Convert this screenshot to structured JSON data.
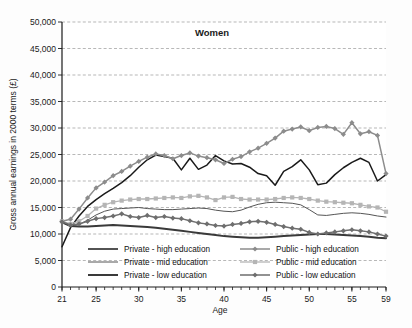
{
  "chart_data": {
    "type": "line",
    "title": "Women",
    "xlabel": "Age",
    "ylabel": "Gross annual earnings in 2000 terms (£)",
    "xlim": [
      21,
      59
    ],
    "ylim": [
      0,
      50000
    ],
    "ytick_labels": [
      "0",
      "5,000",
      "10,000",
      "15,000",
      "20,000",
      "25,000",
      "30,000",
      "35,000",
      "40,000",
      "45,000",
      "50,000"
    ],
    "ytick_values": [
      0,
      5000,
      10000,
      15000,
      20000,
      25000,
      30000,
      35000,
      40000,
      45000,
      50000
    ],
    "xtick_labels": [
      "21",
      "25",
      "30",
      "35",
      "40",
      "45",
      "50",
      "55",
      "59"
    ],
    "xtick_values": [
      21,
      25,
      30,
      35,
      40,
      45,
      50,
      55,
      59
    ],
    "grid": "horizontal-dashed",
    "legend_position": "inside-bottom",
    "x": [
      21,
      22,
      23,
      24,
      25,
      26,
      27,
      28,
      29,
      30,
      31,
      32,
      33,
      34,
      35,
      36,
      37,
      38,
      39,
      40,
      41,
      42,
      43,
      44,
      45,
      46,
      47,
      48,
      49,
      50,
      51,
      52,
      53,
      54,
      55,
      56,
      57,
      58,
      59
    ],
    "series": [
      {
        "name": "Private - high education",
        "color": "#1a1a1a",
        "marker": "none",
        "width": 1.5,
        "values": [
          7600,
          11200,
          13400,
          15200,
          16500,
          17600,
          18600,
          19700,
          21000,
          22600,
          24000,
          24900,
          24600,
          24300,
          22100,
          24300,
          22200,
          23000,
          24800,
          23800,
          23200,
          23300,
          22600,
          21400,
          21000,
          19200,
          21800,
          22700,
          24000,
          22100,
          19300,
          19600,
          21200,
          22500,
          23500,
          24300,
          23500,
          20000,
          21200
        ]
      },
      {
        "name": "Private - mid education",
        "color": "#555555",
        "marker": "none",
        "width": 1.0,
        "values": [
          12300,
          11600,
          11800,
          12600,
          13600,
          14300,
          14700,
          14800,
          14900,
          15000,
          14800,
          14700,
          14600,
          14600,
          14700,
          14800,
          14900,
          14800,
          14500,
          14300,
          14200,
          14500,
          15100,
          15600,
          15900,
          16000,
          15900,
          15800,
          15500,
          14600,
          13600,
          13500,
          13700,
          13900,
          14000,
          13900,
          13700,
          13400,
          13200
        ]
      },
      {
        "name": "Private - low education",
        "color": "#3a3a3a",
        "marker": "none",
        "width": 2.0,
        "values": [
          12200,
          11500,
          11400,
          11400,
          11500,
          11600,
          11700,
          11600,
          11500,
          11400,
          11300,
          11200,
          11000,
          10800,
          10600,
          10400,
          10200,
          10000,
          9800,
          9600,
          9500,
          9400,
          9300,
          9300,
          9400,
          9500,
          9600,
          9700,
          9800,
          9900,
          10000,
          10000,
          9900,
          9800,
          9700,
          9600,
          9500,
          9300,
          9200
        ]
      },
      {
        "name": "Public - high education",
        "color": "#8c8c8c",
        "marker": "diamond",
        "width": 1.5,
        "values": [
          12400,
          12800,
          14700,
          16800,
          18700,
          19800,
          21000,
          21800,
          22800,
          23700,
          24500,
          25100,
          24800,
          24200,
          24800,
          25300,
          24700,
          24400,
          24000,
          23300,
          24100,
          24600,
          25500,
          26200,
          27100,
          28100,
          29400,
          29800,
          30200,
          29500,
          30100,
          30300,
          29900,
          28800,
          31000,
          28900,
          29300,
          28600,
          21400
        ]
      },
      {
        "name": "Public - mid education",
        "color": "#b5b5b5",
        "marker": "square",
        "width": 1.3,
        "values": [
          12400,
          11900,
          12400,
          13400,
          14800,
          15500,
          16000,
          16300,
          16500,
          16600,
          16600,
          16700,
          16800,
          16900,
          16800,
          17100,
          17200,
          16900,
          16400,
          16900,
          17000,
          16600,
          16500,
          16500,
          16500,
          16600,
          16800,
          16900,
          16800,
          16600,
          16300,
          16100,
          16000,
          15900,
          15800,
          15500,
          15200,
          15000,
          14200
        ]
      },
      {
        "name": "Public - low education",
        "color": "#6e6e6e",
        "marker": "diamond",
        "width": 1.5,
        "values": [
          12300,
          11700,
          11900,
          12400,
          12900,
          13100,
          13400,
          13800,
          13300,
          13100,
          13500,
          13100,
          13300,
          13000,
          12900,
          12500,
          12100,
          11900,
          11600,
          11500,
          11800,
          12000,
          12300,
          12400,
          12200,
          11800,
          11400,
          11100,
          10900,
          10300,
          10000,
          10200,
          10400,
          10600,
          10800,
          10600,
          10400,
          10000,
          9600
        ]
      }
    ],
    "legend": [
      {
        "label": "Private - high education",
        "series": 0
      },
      {
        "label": "Private - mid education",
        "series": 1
      },
      {
        "label": "Private - low education",
        "series": 2
      },
      {
        "label": "Public - high education",
        "series": 3
      },
      {
        "label": "Public - mid education",
        "series": 4
      },
      {
        "label": "Public - low education",
        "series": 5
      }
    ]
  }
}
